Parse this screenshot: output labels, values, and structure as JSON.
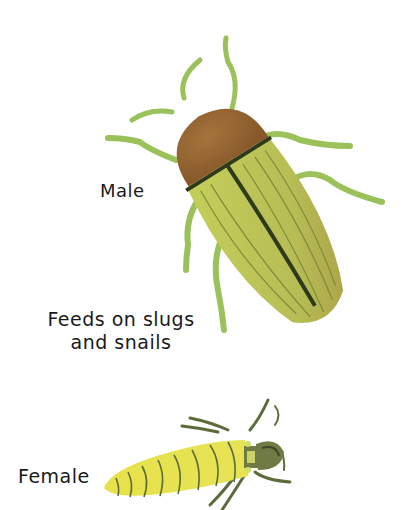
{
  "illustration": {
    "subject": "beetle male and female",
    "labels": {
      "male": "Male",
      "feeds_line1": "Feeds on slugs",
      "feeds_line2": "and snails",
      "female": "Female"
    },
    "colors": {
      "background": "#ffffff",
      "male_head": "#9a6a35",
      "male_body": "#b8c25a",
      "male_stripe": "#2e3a1c",
      "legs": "#9bc25a",
      "female_body": "#e6e24a",
      "female_stripes": "#5c6b3a",
      "female_head": "#6f7a45",
      "text": "#1a1a1a"
    }
  }
}
